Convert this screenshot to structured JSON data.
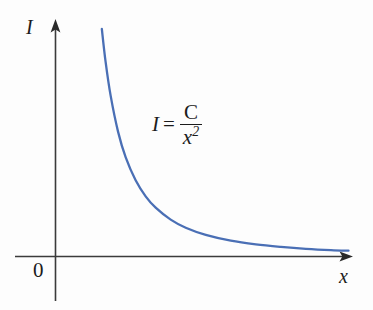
{
  "figure": {
    "background_color": "#fdfdfd",
    "axis_color": "#3b3b3b",
    "curve_color": "#4a6fb5",
    "text_color": "#1c1c1c"
  },
  "annotations": {
    "equation": {
      "lhs": "I",
      "relation": "=",
      "numerator": "C",
      "denominator_base": "x",
      "denominator_exponent": "2",
      "full_text": "I = C/x²"
    }
  },
  "chart_data": {
    "type": "line",
    "title": "",
    "subtitle": "",
    "xlabel": "x",
    "ylabel": "I",
    "origin_label": "0",
    "grid": false,
    "legend": null,
    "axis_arrows": {
      "x": "right",
      "y": "up"
    },
    "xlim": [
      0,
      12
    ],
    "ylim": [
      0,
      12
    ],
    "equation": "I = C/x^2",
    "relationship": "inverse-square",
    "series": [
      {
        "name": "I = C/x²",
        "color": "#4a6fb5",
        "x": [
          1.85,
          2.0,
          2.2,
          2.5,
          2.8,
          3.2,
          3.6,
          4.0,
          4.6,
          5.2,
          6.0,
          7.0,
          8.0,
          9.0,
          10.0,
          11.0,
          11.7
        ],
        "y": [
          11.8,
          10.1,
          8.35,
          6.46,
          5.15,
          3.95,
          3.12,
          2.53,
          1.91,
          1.49,
          1.12,
          0.82,
          0.63,
          0.5,
          0.4,
          0.33,
          0.3
        ]
      }
    ],
    "annotations": [
      {
        "text": "I = C/x²",
        "x": 4.6,
        "y": 7.4
      }
    ]
  }
}
